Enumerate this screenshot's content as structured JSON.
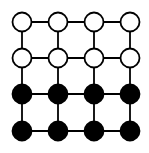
{
  "diagram": {
    "type": "grid-graph",
    "rows": 4,
    "cols": 4,
    "x_positions": [
      22,
      58,
      94,
      130
    ],
    "y_positions": [
      22,
      58,
      94,
      131
    ],
    "node_radius": 9.5,
    "edge_color": "#000000",
    "node_stroke": "#000000",
    "rows_fill": [
      "#ffffff",
      "#ffffff",
      "#000000",
      "#000000"
    ],
    "nodes": [
      {
        "row": 0,
        "col": 0,
        "state": "white"
      },
      {
        "row": 0,
        "col": 1,
        "state": "white"
      },
      {
        "row": 0,
        "col": 2,
        "state": "white"
      },
      {
        "row": 0,
        "col": 3,
        "state": "white"
      },
      {
        "row": 1,
        "col": 0,
        "state": "white"
      },
      {
        "row": 1,
        "col": 1,
        "state": "white"
      },
      {
        "row": 1,
        "col": 2,
        "state": "white"
      },
      {
        "row": 1,
        "col": 3,
        "state": "white"
      },
      {
        "row": 2,
        "col": 0,
        "state": "black"
      },
      {
        "row": 2,
        "col": 1,
        "state": "black"
      },
      {
        "row": 2,
        "col": 2,
        "state": "black"
      },
      {
        "row": 2,
        "col": 3,
        "state": "black"
      },
      {
        "row": 3,
        "col": 0,
        "state": "black"
      },
      {
        "row": 3,
        "col": 1,
        "state": "black"
      },
      {
        "row": 3,
        "col": 2,
        "state": "black"
      },
      {
        "row": 3,
        "col": 3,
        "state": "black"
      }
    ]
  }
}
